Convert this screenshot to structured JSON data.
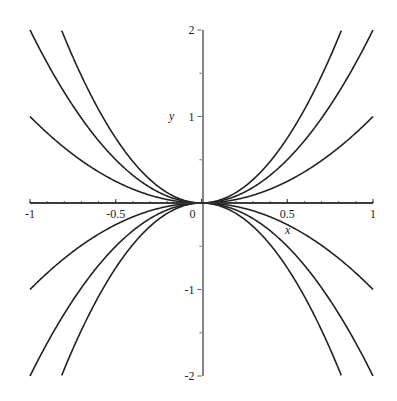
{
  "chart_data": {
    "type": "line",
    "title": "",
    "xlabel": "x",
    "ylabel": "y",
    "xlim": [
      -1,
      1
    ],
    "ylim": [
      -2,
      2
    ],
    "grid": false,
    "legend": null,
    "x_ticks": [
      -1,
      -0.5,
      0,
      0.5,
      1
    ],
    "x_tick_labels": [
      "-1",
      "-0.5",
      "0",
      "0.5",
      "1"
    ],
    "y_ticks": [
      -2,
      -1,
      1,
      2
    ],
    "y_tick_labels": [
      "-2",
      "-1",
      "1",
      "2"
    ],
    "series": [
      {
        "name": "y = 3x^2",
        "c": 3
      },
      {
        "name": "y = 2x^2",
        "c": 2
      },
      {
        "name": "y = x^2",
        "c": 1
      },
      {
        "name": "y = 0",
        "c": 0
      },
      {
        "name": "y = -x^2",
        "c": -1
      },
      {
        "name": "y = -2x^2",
        "c": -2
      },
      {
        "name": "y = -3x^2",
        "c": -3
      }
    ],
    "line_color": "#222222"
  }
}
